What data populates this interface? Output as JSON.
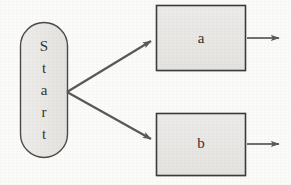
{
  "diagram": {
    "type": "flowchart",
    "canvas": {
      "width": 291,
      "height": 185,
      "background": "#fbfbf9"
    },
    "colors": {
      "node_fill": "#e9e8e6",
      "node_stroke": "#3a3a38",
      "start_stroke": "#4a4846",
      "edge": "#595753",
      "text": "#33312f"
    },
    "start_node": {
      "label": "Start",
      "letters": [
        "S",
        "t",
        "a",
        "r",
        "t"
      ],
      "shape": "stadium",
      "orientation": "vertical-text",
      "x": 20,
      "y": 22,
      "width": 48,
      "height": 136
    },
    "process_nodes": [
      {
        "id": "a",
        "label": "a",
        "shape": "rectangle",
        "x": 156,
        "y": 5,
        "width": 90,
        "height": 67
      },
      {
        "id": "b",
        "label": "b",
        "shape": "rectangle",
        "x": 156,
        "y": 113,
        "width": 90,
        "height": 64
      }
    ],
    "edges": [
      {
        "id": "start-to-a",
        "from": "Start",
        "to": "a",
        "x1": 67,
        "y1": 92,
        "x2": 155,
        "y2": 39,
        "arrowhead": "end"
      },
      {
        "id": "start-to-b",
        "from": "Start",
        "to": "b",
        "x1": 67,
        "y1": 92,
        "x2": 155,
        "y2": 142,
        "arrowhead": "end"
      },
      {
        "id": "a-out",
        "from": "a",
        "to": "",
        "x1": 247,
        "y1": 38,
        "x2": 286,
        "y2": 38,
        "arrowhead": "end"
      },
      {
        "id": "b-out",
        "from": "b",
        "to": "",
        "x1": 247,
        "y1": 144,
        "x2": 286,
        "y2": 144,
        "arrowhead": "end"
      }
    ]
  }
}
